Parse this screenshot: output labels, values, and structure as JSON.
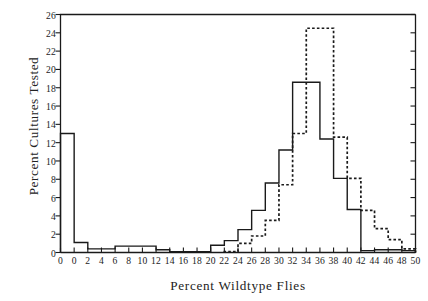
{
  "chart_data": {
    "type": "line",
    "title": "",
    "xlabel": "Percent Wildtype Flies",
    "ylabel": "Percent Cultures Tested",
    "xlim": [
      -2,
      50
    ],
    "ylim": [
      0,
      26
    ],
    "xticks": [
      -2,
      0,
      2,
      4,
      6,
      8,
      10,
      12,
      14,
      16,
      18,
      20,
      22,
      24,
      26,
      28,
      30,
      32,
      34,
      36,
      38,
      40,
      42,
      44,
      46,
      48,
      50
    ],
    "xtick_labels": [
      "0",
      "0",
      "2",
      "4",
      "6",
      "8",
      "10",
      "12",
      "14",
      "16",
      "18",
      "20",
      "22",
      "24",
      "26",
      "28",
      "30",
      "32",
      "34",
      "36",
      "38",
      "40",
      "42",
      "44",
      "46",
      "48",
      "50"
    ],
    "yticks": [
      0,
      2,
      4,
      6,
      8,
      10,
      12,
      14,
      16,
      18,
      20,
      22,
      24,
      26
    ],
    "ytick_labels": [
      "0",
      "2",
      "4",
      "6",
      "8",
      "10",
      "12",
      "14",
      "16",
      "18",
      "20",
      "22",
      "24",
      "26"
    ],
    "grid": false,
    "legend": "none",
    "bin_width": 2,
    "series": [
      {
        "name": "solid",
        "style": "solid",
        "color": "#1a1a1a",
        "bin_starts": [
          -2,
          0,
          2,
          4,
          6,
          8,
          10,
          12,
          14,
          16,
          18,
          20,
          22,
          24,
          26,
          28,
          30,
          32,
          34,
          36,
          38,
          40,
          42,
          44,
          46,
          48
        ],
        "values": [
          13.0,
          1.1,
          0.4,
          0.4,
          0.7,
          0.7,
          0.7,
          0.3,
          0.1,
          0.1,
          0.1,
          0.8,
          1.3,
          2.5,
          4.6,
          7.6,
          11.2,
          18.6,
          18.6,
          12.4,
          8.1,
          4.7,
          0.2,
          0.3,
          0.3,
          0.2
        ]
      },
      {
        "name": "dashed",
        "style": "dashed",
        "color": "#1a1a1a",
        "bin_starts": [
          22,
          24,
          26,
          28,
          30,
          32,
          34,
          36,
          38,
          40,
          42,
          44,
          46,
          48
        ],
        "values": [
          0.1,
          1.0,
          1.8,
          3.5,
          7.4,
          13.0,
          24.5,
          24.5,
          12.6,
          8.1,
          4.6,
          2.6,
          1.4,
          0.4
        ]
      }
    ]
  }
}
